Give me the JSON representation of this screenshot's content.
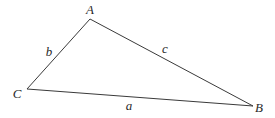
{
  "diagram": {
    "type": "triangle",
    "stroke_color": "#3a3a3a",
    "vertices": [
      {
        "id": "A",
        "label": "A",
        "x": 90,
        "y": 19,
        "label_x": 90,
        "label_y": 9
      },
      {
        "id": "B",
        "label": "B",
        "x": 253,
        "y": 106,
        "label_x": 259,
        "label_y": 107
      },
      {
        "id": "C",
        "label": "C",
        "x": 27,
        "y": 89,
        "label_x": 17,
        "label_y": 93
      }
    ],
    "sides": [
      {
        "id": "a",
        "label": "a",
        "from": "C",
        "to": "B",
        "label_x": 129,
        "label_y": 105
      },
      {
        "id": "b",
        "label": "b",
        "from": "C",
        "to": "A",
        "label_x": 49,
        "label_y": 51
      },
      {
        "id": "c",
        "label": "c",
        "from": "A",
        "to": "B",
        "label_x": 165,
        "label_y": 48
      }
    ]
  }
}
